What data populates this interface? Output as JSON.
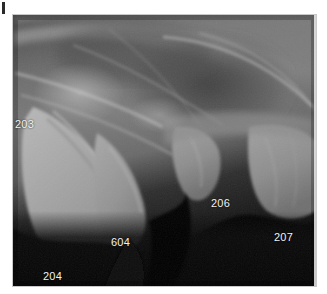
{
  "page": {
    "background_color": "#ffffff",
    "corner_mark": {
      "name": "crop-mark",
      "color": "#2a2a2a"
    }
  },
  "radiograph": {
    "title": "Dental radiograph",
    "modality": "intraoral dental X-ray",
    "frame": {
      "x": 13,
      "y": 15,
      "width": 303,
      "height": 271
    },
    "background_color": "#0a0a0a",
    "border_color": "#c9c9c9",
    "label_color": "#f2f2f2",
    "label_font_size_px": 11,
    "labels": [
      {
        "id": "203",
        "text": "203",
        "x": 2,
        "y": 104,
        "description": "maxillary third incisor region"
      },
      {
        "id": "204",
        "text": "204",
        "x": 30,
        "y": 256,
        "description": "maxillary canine apex"
      },
      {
        "id": "604",
        "text": "604",
        "x": 98,
        "y": 222,
        "description": "deciduous maxillary canine"
      },
      {
        "id": "206",
        "text": "206",
        "x": 198,
        "y": 183,
        "description": "maxillary second premolar"
      },
      {
        "id": "207",
        "text": "207",
        "x": 261,
        "y": 217,
        "description": "maxillary third premolar"
      }
    ]
  }
}
